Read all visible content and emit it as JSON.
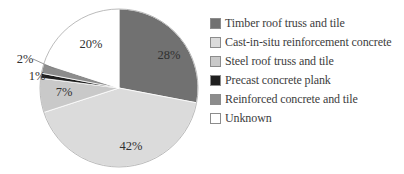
{
  "chart_data": {
    "type": "pie",
    "title": "",
    "label_suffix": "%",
    "data_labels": "percent",
    "legend_position": "right",
    "start_angle_deg": 0,
    "direction": "clockwise",
    "slices": [
      {
        "label": "Timber roof truss and tile",
        "value": 28,
        "color": "#717171"
      },
      {
        "label": "Cast-in-situ reinforcement concrete",
        "value": 42,
        "color": "#dbdbdb"
      },
      {
        "label": "Steel roof truss and tile",
        "value": 7,
        "color": "#c9c9c9"
      },
      {
        "label": "Precast concrete plank",
        "value": 1,
        "color": "#1f1f1f"
      },
      {
        "label": "Reinforced concrete and tile",
        "value": 2,
        "color": "#8c8c8c"
      },
      {
        "label": "Unknown",
        "value": 20,
        "color": "#ffffff"
      }
    ],
    "layout": {
      "center": [
        119,
        88
      ],
      "radius": 79,
      "outline_color": "#b3b3b3",
      "label_color": "#303030",
      "label_positions": [
        [
          169,
          59
        ],
        [
          131,
          150
        ],
        [
          64,
          96
        ],
        [
          37,
          80
        ],
        [
          25,
          63
        ],
        [
          91,
          48
        ]
      ],
      "outside_label_indices": [
        3,
        4
      ],
      "leader_line": [
        33,
        59,
        55,
        69
      ],
      "leader_line_color": "#7f7f7f"
    }
  }
}
